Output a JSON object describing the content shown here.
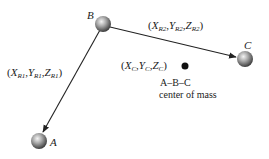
{
  "diagram": {
    "atoms": [
      {
        "id": "A",
        "label": "A",
        "cx": 39,
        "cy": 141,
        "r": 8
      },
      {
        "id": "B",
        "label": "B",
        "cx": 103,
        "cy": 24,
        "r": 8
      },
      {
        "id": "C",
        "label": "C",
        "cx": 245,
        "cy": 59,
        "r": 8
      }
    ],
    "vectors": [
      {
        "from": "B",
        "to": "A",
        "label": {
          "open": "(",
          "X": "X",
          "Xsub": "R1",
          "Y": "Y",
          "Ysub": "R1",
          "Z": "Z",
          "Zsub": "R1",
          "close": ")"
        }
      },
      {
        "from": "B",
        "to": "C",
        "label": {
          "open": "(",
          "X": "X",
          "Xsub": "R2",
          "Y": "Y",
          "Ysub": "R2",
          "Z": "Z",
          "Zsub": "R2",
          "close": ")"
        }
      }
    ],
    "center_of_mass": {
      "coords": {
        "open": "(",
        "X": "X",
        "Xsub": "C",
        "Y": "Y",
        "Ysub": "C",
        "Z": "Z",
        "Zsub": "C",
        "close": ")"
      },
      "caption_line1": "A–B–C",
      "caption_line2": "center of mass",
      "dot": {
        "cx": 185,
        "cy": 66,
        "r": 3.5
      }
    },
    "separator": ",",
    "colors": {
      "line": "#222222",
      "atom_light": "#f2f2f2",
      "atom_mid": "#9a9a9a",
      "atom_dark": "#4a4a4a",
      "dot": "#111111"
    }
  }
}
